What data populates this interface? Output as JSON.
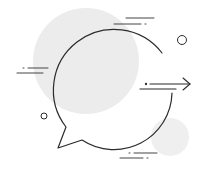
{
  "illustration": {
    "subject": "speech-bubble-with-arrow",
    "colors": {
      "background": "#ffffff",
      "blob": "#ececec",
      "blob_small": "#eeeeee",
      "stroke": "#2b2b2b",
      "accent_stroke": "#555555"
    }
  }
}
